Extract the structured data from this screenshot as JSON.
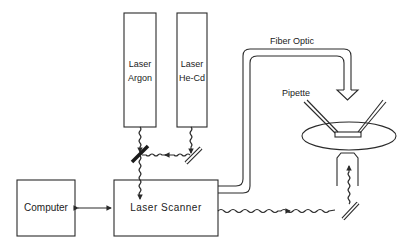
{
  "diagram": {
    "stroke_color": "#2a2a2a",
    "background": "#ffffff",
    "components": {
      "laser_argon": {
        "line1": "Laser",
        "line2": "Argon"
      },
      "laser_hecd": {
        "line1": "Laser",
        "line2": "He-Cd"
      },
      "computer": {
        "label": "Computer"
      },
      "laser_scanner": {
        "label": "Laser Scanner"
      },
      "fiber_optic": {
        "label": "Fiber Optic"
      },
      "pipette": {
        "label": "Pipette"
      }
    },
    "connections": [
      {
        "from": "laser_argon",
        "to": "mirror_argon",
        "type": "beam"
      },
      {
        "from": "laser_hecd",
        "to": "mirror_hecd",
        "type": "beam"
      },
      {
        "from": "mirror_hecd",
        "to": "mirror_argon",
        "type": "beam"
      },
      {
        "from": "mirror_argon",
        "to": "laser_scanner",
        "type": "beam"
      },
      {
        "from": "computer",
        "to": "laser_scanner",
        "type": "bidirectional"
      },
      {
        "from": "laser_scanner",
        "to": "dish",
        "type": "fiber_optic"
      },
      {
        "from": "laser_scanner",
        "to": "mirror_objective",
        "type": "beam"
      },
      {
        "from": "mirror_objective",
        "to": "objective",
        "type": "beam"
      }
    ]
  }
}
